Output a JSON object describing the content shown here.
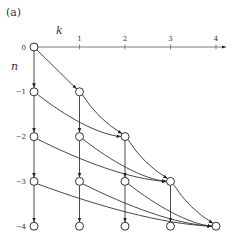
{
  "panel_label": "(a)",
  "axes": {
    "k_label": "k",
    "n_label": "n",
    "k_ticks": [
      "1",
      "2",
      "3",
      "4"
    ],
    "n_ticks": [
      "0",
      "−1",
      "−2",
      "−3",
      "−4"
    ]
  },
  "nodes": [
    {
      "k": 0,
      "n": 0
    },
    {
      "k": 0,
      "n": -1
    },
    {
      "k": 1,
      "n": -1
    },
    {
      "k": 0,
      "n": -2
    },
    {
      "k": 1,
      "n": -2
    },
    {
      "k": 2,
      "n": -2
    },
    {
      "k": 0,
      "n": -3
    },
    {
      "k": 1,
      "n": -3
    },
    {
      "k": 2,
      "n": -3
    },
    {
      "k": 3,
      "n": -3
    },
    {
      "k": 0,
      "n": -4
    },
    {
      "k": 1,
      "n": -4
    },
    {
      "k": 2,
      "n": -4
    },
    {
      "k": 3,
      "n": -4
    },
    {
      "k": 4,
      "n": -4
    }
  ],
  "edges": [
    {
      "from": [
        0,
        0
      ],
      "to": [
        0,
        -1
      ]
    },
    {
      "from": [
        0,
        -1
      ],
      "to": [
        0,
        -2
      ]
    },
    {
      "from": [
        0,
        -2
      ],
      "to": [
        0,
        -3
      ]
    },
    {
      "from": [
        0,
        -3
      ],
      "to": [
        0,
        -4
      ]
    },
    {
      "from": [
        1,
        -1
      ],
      "to": [
        1,
        -2
      ]
    },
    {
      "from": [
        1,
        -2
      ],
      "to": [
        1,
        -3
      ]
    },
    {
      "from": [
        1,
        -3
      ],
      "to": [
        1,
        -4
      ]
    },
    {
      "from": [
        2,
        -2
      ],
      "to": [
        2,
        -3
      ]
    },
    {
      "from": [
        2,
        -3
      ],
      "to": [
        2,
        -4
      ]
    },
    {
      "from": [
        3,
        -3
      ],
      "to": [
        3,
        -4
      ]
    },
    {
      "from": [
        0,
        0
      ],
      "to": [
        1,
        -1
      ]
    },
    {
      "from": [
        0,
        -1
      ],
      "to": [
        2,
        -2
      ]
    },
    {
      "from": [
        1,
        -1
      ],
      "to": [
        2,
        -2
      ]
    },
    {
      "from": [
        0,
        -2
      ],
      "to": [
        3,
        -3
      ]
    },
    {
      "from": [
        1,
        -2
      ],
      "to": [
        3,
        -3
      ]
    },
    {
      "from": [
        2,
        -2
      ],
      "to": [
        3,
        -3
      ]
    },
    {
      "from": [
        0,
        -3
      ],
      "to": [
        4,
        -4
      ]
    },
    {
      "from": [
        1,
        -3
      ],
      "to": [
        4,
        -4
      ]
    },
    {
      "from": [
        2,
        -3
      ],
      "to": [
        4,
        -4
      ]
    },
    {
      "from": [
        3,
        -3
      ],
      "to": [
        4,
        -4
      ]
    }
  ]
}
